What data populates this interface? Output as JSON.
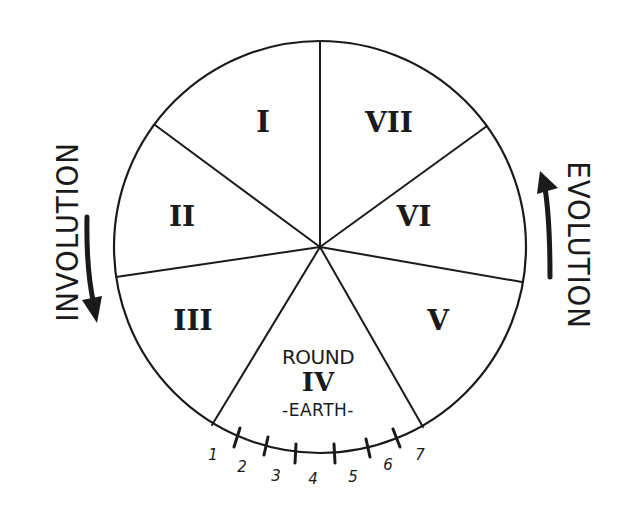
{
  "diagram": {
    "colors": {
      "ink": "#1a1a1a",
      "background": "#ffffff"
    },
    "wheel": {
      "cx": 320,
      "cy": 247,
      "r": 206
    },
    "segments": [
      {
        "id": "I",
        "label": "I",
        "x": 263,
        "y": 122
      },
      {
        "id": "II",
        "label": "II",
        "x": 182,
        "y": 216
      },
      {
        "id": "III",
        "label": "III",
        "x": 192,
        "y": 320
      },
      {
        "id": "IV",
        "label": "IV",
        "round_label": "ROUND",
        "sub_label": "-EARTH-",
        "x": 320,
        "y": 388
      },
      {
        "id": "V",
        "label": "V",
        "x": 438,
        "y": 320
      },
      {
        "id": "VI",
        "label": "VI",
        "x": 413,
        "y": 216
      },
      {
        "id": "VII",
        "label": "VII",
        "x": 389,
        "y": 122
      }
    ],
    "round_iv": {
      "round_label": "ROUND",
      "numeral": "IV",
      "sub_label": "-EARTH-"
    },
    "left_label": {
      "text": "INVOLUTION",
      "arrow_direction": "down"
    },
    "right_label": {
      "text": "EVOLUTION",
      "arrow_direction": "up"
    },
    "sub_ticks": {
      "labels": [
        "1",
        "2",
        "3",
        "4",
        "5",
        "6",
        "7"
      ]
    }
  }
}
